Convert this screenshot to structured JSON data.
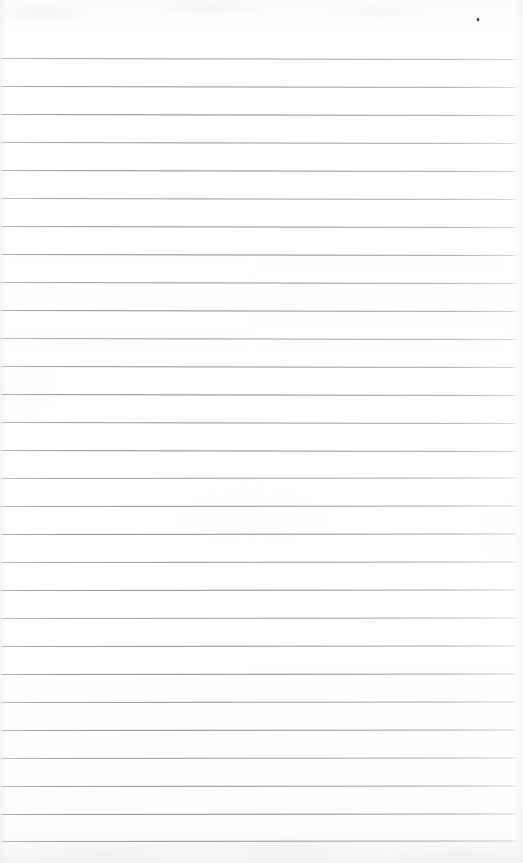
{
  "document": {
    "kind": "scanned-ruled-notebook-page",
    "title": "Blank ruled page",
    "page_width": 523,
    "page_height": 863,
    "text_content": "",
    "handwriting_present": "no",
    "printed_text_present": "no"
  },
  "paper": {
    "background_color": "#fefefe",
    "edge_tone_color": "#f4f4f5",
    "has_vertical_margin_rule": "no",
    "orientation": "portrait"
  },
  "ruling": {
    "line_color": "#7d8089",
    "line_thickness_px": 1,
    "line_spacing_px": 28,
    "first_line_y": 58,
    "line_count": 29,
    "left_inset_px": 0,
    "right_end_px": 518,
    "slant_degrees": 0.12,
    "top_margin_px": 58,
    "bottom_margin_px": 20,
    "line_y_positions": [
      58,
      86,
      114,
      142,
      170,
      198,
      226,
      254,
      282,
      310,
      338,
      366,
      394,
      422,
      450,
      478,
      506,
      534,
      562,
      590,
      618,
      646,
      674,
      702,
      730,
      758,
      786,
      814,
      841
    ]
  },
  "artifacts": {
    "speck": {
      "label": "ink-speck",
      "x": 477,
      "y": 18,
      "color": "#2e2f33"
    }
  }
}
